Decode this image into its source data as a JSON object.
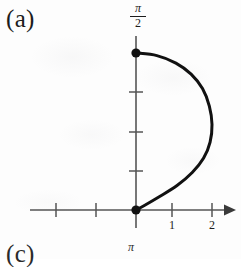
{
  "figure": {
    "panel_label": "(a)",
    "next_panel_label": "(c)",
    "next_figure_axis_label": "π"
  },
  "axes": {
    "y_axis": {
      "max_label_numerator": "π",
      "max_label_denominator": "2",
      "max_label_text": "π/2",
      "arrowhead": false,
      "tick_count_visible": 3,
      "tick_labels": []
    },
    "x_axis": {
      "arrowhead": true,
      "tick_labels": [
        "1",
        "2"
      ],
      "unlabeled_tick_count": 2
    }
  },
  "chart_data": {
    "type": "line",
    "title": "(a)",
    "xlabel": "",
    "ylabel": "",
    "xlim": [
      -2.6,
      2.6
    ],
    "ylim": [
      0,
      1.75
    ],
    "grid": false,
    "legend": null,
    "x_ticks": [
      -2,
      -1,
      1,
      2
    ],
    "x_tick_labels": [
      "",
      "",
      "1",
      "2"
    ],
    "y_ticks": [
      0.3927,
      0.7854,
      1.1781,
      1.5708
    ],
    "y_tick_labels": [
      "",
      "",
      "",
      "π/2"
    ],
    "series": [
      {
        "name": "arc",
        "stroke": "#111111",
        "stroke_width": 3,
        "closed": false,
        "comment": "half-loop from (0, pi/2) bulging right to x=2 and returning to the origin (0,0)",
        "x": [
          0.0,
          0.55,
          1.05,
          1.45,
          1.75,
          1.93,
          2.0,
          1.95,
          1.78,
          1.48,
          1.08,
          0.6,
          0.22,
          0.0
        ],
        "y": [
          1.571,
          1.545,
          1.47,
          1.36,
          1.215,
          1.04,
          0.855,
          0.68,
          0.52,
          0.375,
          0.245,
          0.13,
          0.045,
          0.0
        ]
      }
    ],
    "points": [
      {
        "name": "top-endpoint",
        "x": 0,
        "y": 1.5708,
        "label": "",
        "marker": "filled-circle"
      },
      {
        "name": "origin-endpoint",
        "x": 0,
        "y": 0,
        "label": "",
        "marker": "filled-circle"
      }
    ]
  },
  "colors": {
    "curve": "#111111",
    "axis": "#555555",
    "text": "#1c1c1c",
    "background": "#fdfdfd"
  }
}
